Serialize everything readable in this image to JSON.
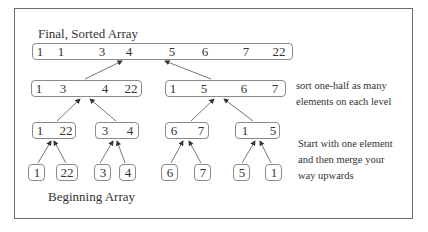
{
  "diagram": {
    "title_top": "Final, Sorted Array",
    "title_bottom": "Beginning Array",
    "note_upper": [
      "sort one-half as many",
      "elements  on each level"
    ],
    "note_lower": [
      "Start with one element",
      "and then merge your",
      "way upwards"
    ],
    "levels": {
      "final": [
        [
          1,
          1,
          3,
          4,
          5,
          6,
          7,
          22
        ]
      ],
      "halves": [
        [
          1,
          3,
          4,
          22
        ],
        [
          1,
          5,
          6,
          7
        ]
      ],
      "pairs": [
        [
          1,
          22
        ],
        [
          3,
          4
        ],
        [
          6,
          7
        ],
        [
          1,
          5
        ]
      ],
      "singles": [
        [
          1
        ],
        [
          22
        ],
        [
          3
        ],
        [
          4
        ],
        [
          6
        ],
        [
          7
        ],
        [
          5
        ],
        [
          1
        ]
      ]
    }
  }
}
